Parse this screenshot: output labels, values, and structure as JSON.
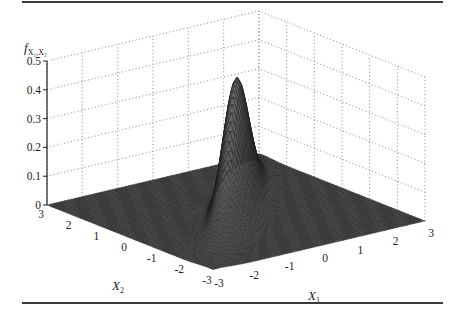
{
  "chart_data": {
    "type": "surface",
    "title": "",
    "zlabel": "f_{X1,X2}",
    "zlabel_text": "f",
    "zlabel_sub": "X₁,X₂",
    "xlabel": "X1",
    "xlabel_text": "X",
    "xlabel_sub": "1",
    "ylabel": "X2",
    "ylabel_text": "X",
    "ylabel_sub": "2",
    "x_ticks": [
      -3,
      -2,
      -1,
      0,
      1,
      2,
      3
    ],
    "x_tick_labels": [
      "-3",
      "-2",
      "-1",
      "0",
      "1",
      "2",
      "3"
    ],
    "y_ticks": [
      -3,
      -2,
      -1,
      0,
      1,
      2,
      3
    ],
    "y_tick_labels": [
      "-3",
      "-2",
      "-1",
      "0",
      "1",
      "2",
      "3"
    ],
    "z_ticks": [
      0,
      0.1,
      0.2,
      0.3,
      0.4,
      0.5
    ],
    "z_tick_labels": [
      "0",
      "0.1",
      "0.2",
      "0.3",
      "0.4",
      "0.5"
    ],
    "xlim": [
      -3,
      3
    ],
    "ylim": [
      -3,
      3
    ],
    "zlim": [
      0,
      0.5
    ],
    "grid": true,
    "grid_style": "dotted",
    "distribution": {
      "mean": [
        0,
        0
      ],
      "std": [
        1,
        1
      ],
      "correlation": 0.94
    },
    "peak_value": 0.47,
    "mesh_resolution": 60,
    "colors": {
      "surface_fill": "#6a6a6a",
      "mesh_line": "#1c1c1c",
      "grid": "#8a8a8a",
      "axis": "#222222",
      "rule": "#3a3a3a"
    }
  }
}
